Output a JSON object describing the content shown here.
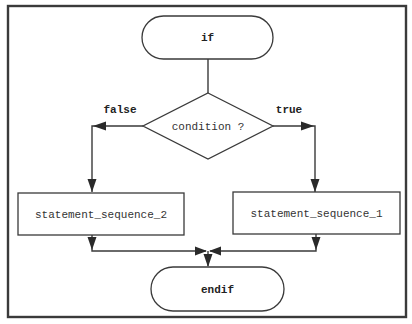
{
  "diagram": {
    "type": "flowchart",
    "nodes": {
      "start": {
        "label": "if",
        "shape": "terminator"
      },
      "decision": {
        "label": "condition ?",
        "shape": "diamond"
      },
      "false_branch": {
        "label": "statement_sequence_2",
        "shape": "process"
      },
      "true_branch": {
        "label": "statement_sequence_1",
        "shape": "process"
      },
      "end": {
        "label": "endif",
        "shape": "terminator"
      }
    },
    "edges": {
      "false_label": "false",
      "true_label": "true"
    },
    "connections": [
      {
        "from": "if",
        "to": "condition ?"
      },
      {
        "from": "condition ?",
        "to": "statement_sequence_2",
        "label": "false"
      },
      {
        "from": "condition ?",
        "to": "statement_sequence_1",
        "label": "true"
      },
      {
        "from": "statement_sequence_2",
        "to": "endif"
      },
      {
        "from": "statement_sequence_1",
        "to": "endif"
      }
    ],
    "colors": {
      "stroke": "#3a3a3a",
      "background": "#ffffff",
      "text": "#333333"
    }
  }
}
